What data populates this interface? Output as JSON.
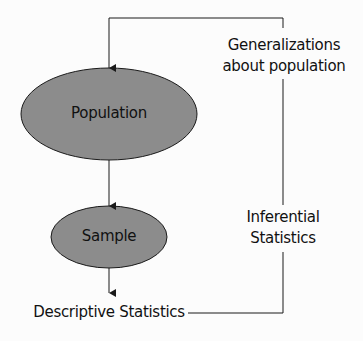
{
  "diagram": {
    "title": "",
    "colors": {
      "ellipse_fill": "#8c8c8c",
      "stroke": "#1a1a1a",
      "background": "#fcfcfc"
    },
    "nodes": {
      "population": {
        "label": "Population"
      },
      "sample": {
        "label": "Sample"
      },
      "descriptive": {
        "label": "Descriptive Statistics"
      }
    },
    "edge_labels": {
      "inferential_line1": "Inferential",
      "inferential_line2": "Statistics",
      "generalizations_line1": "Generalizations",
      "generalizations_line2": "about population"
    }
  }
}
